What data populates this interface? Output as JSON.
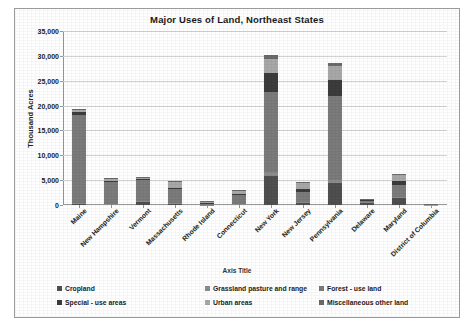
{
  "chart_data": {
    "type": "bar",
    "subtype": "stacked-column",
    "title": "Major Uses of Land, Northeast States",
    "xlabel": "Axis Title",
    "ylabel": "Thousand Acres",
    "ylim": [
      0,
      35000
    ],
    "ytick_step": 5000,
    "yticks": [
      "0",
      "5,000",
      "10,000",
      "15,000",
      "20,000",
      "25,000",
      "30,000",
      "35,000"
    ],
    "grid": true,
    "legend_position": "bottom",
    "categories": [
      "Maine",
      "New Hampshire",
      "Vermont",
      "Massachusetts",
      "Rhode Island",
      "Connecticut",
      "New York",
      "New Jersey",
      "Pennsylvania",
      "Delaware",
      "Maryland",
      "District of Columbia"
    ],
    "series": [
      {
        "name": "Cropland",
        "color": "#4f4f4f",
        "values": [
          400,
          180,
          550,
          250,
          20,
          200,
          5900,
          600,
          4400,
          500,
          1500,
          2
        ]
      },
      {
        "name": "Grassland pasture and range",
        "color": "#8c8c8c",
        "values": [
          30,
          60,
          350,
          80,
          8,
          60,
          700,
          80,
          600,
          30,
          140,
          1
        ]
      },
      {
        "name": "Forest - use land",
        "color": "#7b7b7b",
        "values": [
          17700,
          4300,
          4100,
          2800,
          370,
          1700,
          16200,
          1900,
          16900,
          380,
          2400,
          2
        ]
      },
      {
        "name": "Special - use areas",
        "color": "#3c3c3c",
        "values": [
          620,
          380,
          320,
          390,
          60,
          240,
          3800,
          560,
          3300,
          90,
          700,
          4
        ]
      },
      {
        "name": "Urban areas",
        "color": "#a8a8a8",
        "values": [
          300,
          420,
          230,
          1150,
          250,
          560,
          2800,
          1250,
          2700,
          190,
          1200,
          30
        ]
      },
      {
        "name": "Miscellaneous other land",
        "color": "#6b6b6b",
        "values": [
          250,
          160,
          150,
          230,
          80,
          240,
          700,
          210,
          600,
          60,
          270,
          2
        ]
      }
    ],
    "totals": [
      19300,
      5500,
      5700,
      4900,
      788,
      3000,
      30100,
      4600,
      28500,
      1250,
      6210,
      41
    ]
  },
  "legend": {
    "items": [
      {
        "label": "Cropland",
        "color": "#4f4f4f"
      },
      {
        "label": "Grassland pasture and range",
        "color": "#8c8c8c"
      },
      {
        "label": "Forest - use land",
        "color": "#7b7b7b"
      },
      {
        "label": "Special - use areas",
        "color": "#3c3c3c"
      },
      {
        "label": "Urban areas",
        "color": "#a8a8a8"
      },
      {
        "label": "Miscellaneous other land",
        "color": "#6b6b6b"
      }
    ]
  }
}
